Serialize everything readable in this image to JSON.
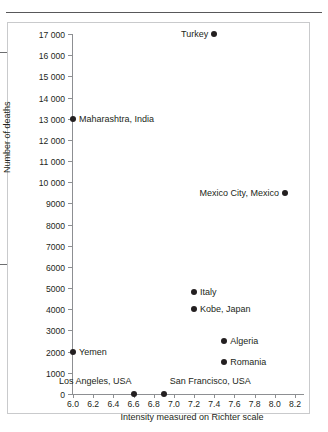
{
  "chart_data": {
    "type": "scatter",
    "title": "",
    "xlabel": "Intensity measured on Richter scale",
    "ylabel": "Number of deaths",
    "xlim": [
      5.9,
      8.25
    ],
    "ylim": [
      0,
      17000
    ],
    "grid": false,
    "legend": "none",
    "xticks": [
      "6.0",
      "6.2",
      "6.4",
      "6.6",
      "6.8",
      "7.0",
      "7.2",
      "7.4",
      "7.6",
      "7.8",
      "8.0",
      "8.2"
    ],
    "xtick_values": [
      6.0,
      6.2,
      6.4,
      6.6,
      6.8,
      7.0,
      7.2,
      7.4,
      7.6,
      7.8,
      8.0,
      8.2
    ],
    "yticks": [
      "0",
      "1000",
      "2000",
      "3000",
      "4000",
      "5000",
      "6000",
      "7000",
      "8000",
      "9000",
      "10 000",
      "11 000",
      "12 000",
      "13 000",
      "14 000",
      "15 000",
      "16 000",
      "17 000"
    ],
    "ytick_values": [
      0,
      1000,
      2000,
      3000,
      4000,
      5000,
      6000,
      7000,
      8000,
      9000,
      10000,
      11000,
      12000,
      13000,
      14000,
      15000,
      16000,
      17000
    ],
    "points": [
      {
        "label": "Turkey",
        "x": 7.4,
        "y": 17000,
        "label_side": "left"
      },
      {
        "label": "Maharashtra, India",
        "x": 6.0,
        "y": 13000,
        "label_side": "right"
      },
      {
        "label": "Mexico City, Mexico",
        "x": 8.1,
        "y": 9500,
        "label_side": "left"
      },
      {
        "label": "Italy",
        "x": 7.2,
        "y": 4800,
        "label_side": "right"
      },
      {
        "label": "Kobe, Japan",
        "x": 7.2,
        "y": 4000,
        "label_side": "right"
      },
      {
        "label": "Algeria",
        "x": 7.5,
        "y": 2500,
        "label_side": "right"
      },
      {
        "label": "Yemen",
        "x": 6.0,
        "y": 2000,
        "label_side": "right"
      },
      {
        "label": "Romania",
        "x": 7.5,
        "y": 1500,
        "label_side": "right"
      },
      {
        "label": "Los Angeles, USA",
        "x": 6.6,
        "y": 0,
        "label_side": "above"
      },
      {
        "label": "San Francisco, USA",
        "x": 6.9,
        "y": 0,
        "label_side": "above-right"
      }
    ]
  }
}
